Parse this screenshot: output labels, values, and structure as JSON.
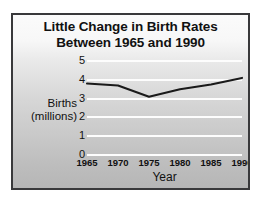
{
  "chart_data": {
    "type": "line",
    "title": "Little Change in Birth Rates Between 1965 and 1990",
    "title_line1": "Little Change in Birth Rates",
    "title_line2": "Between 1965 and 1990",
    "xlabel": "Year",
    "ylabel": "Births (millions)",
    "ylabel_line1": "Births",
    "ylabel_line2": "(millions)",
    "categories": [
      1965,
      1970,
      1975,
      1980,
      1985,
      1990
    ],
    "x_tick_labels": [
      "1965",
      "1970",
      "1975",
      "1980",
      "1985",
      "1990"
    ],
    "values": [
      3.8,
      3.7,
      3.1,
      3.5,
      3.75,
      4.1
    ],
    "series": [
      {
        "name": "Births (millions)",
        "values": [
          3.8,
          3.7,
          3.1,
          3.5,
          3.75,
          4.1
        ]
      }
    ],
    "ylim": [
      0,
      5
    ],
    "y_ticks": [
      0,
      1,
      2,
      3,
      4,
      5
    ],
    "y_tick_labels": [
      "0",
      "1",
      "2",
      "3",
      "4",
      "5"
    ],
    "xlim": [
      1965,
      1990
    ],
    "grid": true,
    "grid_color": "#fdfdfd",
    "legend": "none",
    "line_color": "#1a1a1a",
    "background": "#cccccc",
    "border_color": "#39393b"
  }
}
